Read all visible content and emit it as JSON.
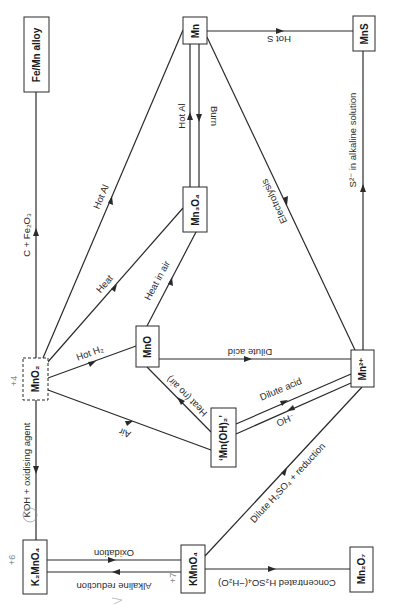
{
  "nodes": {
    "fe_mn_alloy": "Fe/Mn alloy",
    "mn": "Mn",
    "mns": "MnS",
    "mn3o4": "Mn₃O₄",
    "mno2": "MnO₂",
    "mno": "MnO",
    "mn2plus": "Mn²⁺",
    "mn_oh_2": "‘Mn(OH)₂’",
    "k2mno4": "K₂MnO₄",
    "kmno4": "KMnO₄",
    "mn2o7": "Mn₂O₇"
  },
  "edges": {
    "mno2_to_alloy": "C + Fe₂O₃",
    "mno2_to_mn": "Hot Al",
    "mno2_to_mn3o4": "Heat",
    "mno_to_mn3o4": "Heat in air",
    "mno2_to_mno": "Hot H₂",
    "mn3o4_to_mn": "Hot Al",
    "mn_to_mn3o4": "Burn",
    "mn_to_mns": "Hot S",
    "mn2plus_to_mn": "Electrolysis",
    "mn2plus_to_mns": "S²⁻ in alkaline solution",
    "mno_to_mn2plus": "Dilute acid",
    "mnoh2_to_mno": "Heat (no air)",
    "mnoh2_to_mno2": "Air",
    "mnoh2_to_mn2plus": "Dilute acid",
    "mn2plus_to_mnoh2": "OH⁻",
    "kmno4_to_mn2plus": "Dilute H₂SO₄ + reduction",
    "mno2_to_k2mno4": "KOH + oxidising agent",
    "k2mno4_to_kmno4": "Oxidation",
    "kmno4_to_k2mno4": "Alkaline reduction",
    "kmno4_to_mn2o7": "Concentrated H₂SO₄(−H₂O)"
  },
  "annotations": {
    "near_mno2": "+4",
    "near_k2mno4": "+6",
    "near_kmno4": "+7"
  },
  "colors": {
    "line": "#2a2a2a",
    "background": "#ffffff",
    "handwriting": "#8a8a8a"
  }
}
